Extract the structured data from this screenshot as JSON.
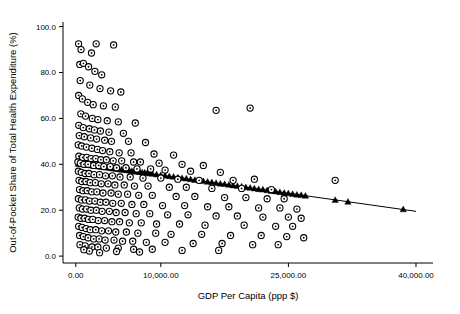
{
  "chart_data": {
    "type": "scatter",
    "title": "",
    "xlabel": "GDP Per Capita (ppp $)",
    "ylabel": "Out-of-Pocket Share of Total Health Expenditure (%)",
    "xlim": [
      -1500,
      42000
    ],
    "ylim": [
      -3,
      102
    ],
    "xticks": [
      0,
      10000,
      25000,
      40000
    ],
    "xticklabels": [
      "0.00",
      "10,000.00",
      "25,000.00",
      "40,000.00"
    ],
    "yticks": [
      0,
      20,
      40,
      60,
      80,
      100
    ],
    "yticklabels": [
      "0.0",
      "20.0",
      "40.0",
      "60.0",
      "80.0",
      "100.0"
    ],
    "grid": false,
    "legend": null,
    "marker_color": "#000000",
    "marker_fill": "#ffffff",
    "fit_color": "#000000",
    "series": [
      {
        "name": "Observed (circles)",
        "marker": "circle-open",
        "points": [
          [
            330,
            92.5
          ],
          [
            620,
            90.0
          ],
          [
            1850,
            88.5
          ],
          [
            2400,
            92.5
          ],
          [
            4450,
            92.0
          ],
          [
            470,
            83.5
          ],
          [
            900,
            84.0
          ],
          [
            1500,
            82.5
          ],
          [
            2250,
            80.5
          ],
          [
            3050,
            79.0
          ],
          [
            520,
            76.5
          ],
          [
            1650,
            74.5
          ],
          [
            2850,
            73.0
          ],
          [
            4100,
            72.0
          ],
          [
            5300,
            71.5
          ],
          [
            340,
            70.0
          ],
          [
            780,
            68.5
          ],
          [
            1400,
            67.0
          ],
          [
            2050,
            66.0
          ],
          [
            3250,
            65.5
          ],
          [
            4650,
            65.0
          ],
          [
            16500,
            63.5
          ],
          [
            20500,
            64.5
          ],
          [
            600,
            62.0
          ],
          [
            1150,
            61.0
          ],
          [
            1950,
            60.0
          ],
          [
            2600,
            59.5
          ],
          [
            3700,
            59.0
          ],
          [
            5000,
            58.5
          ],
          [
            7000,
            58.0
          ],
          [
            350,
            57.0
          ],
          [
            880,
            56.0
          ],
          [
            1600,
            55.5
          ],
          [
            2200,
            55.0
          ],
          [
            2900,
            54.5
          ],
          [
            3900,
            54.0
          ],
          [
            5600,
            53.5
          ],
          [
            410,
            52.5
          ],
          [
            1000,
            52.0
          ],
          [
            1750,
            51.5
          ],
          [
            2450,
            51.0
          ],
          [
            3400,
            50.5
          ],
          [
            4200,
            50.0
          ],
          [
            6200,
            50.0
          ],
          [
            8200,
            49.5
          ],
          [
            290,
            48.5
          ],
          [
            700,
            48.0
          ],
          [
            1250,
            47.5
          ],
          [
            1900,
            47.0
          ],
          [
            2550,
            46.5
          ],
          [
            3150,
            46.0
          ],
          [
            4000,
            45.5
          ],
          [
            5100,
            45.0
          ],
          [
            6500,
            45.0
          ],
          [
            9200,
            44.5
          ],
          [
            11500,
            44.0
          ],
          [
            360,
            43.5
          ],
          [
            810,
            43.0
          ],
          [
            1300,
            43.0
          ],
          [
            1800,
            42.5
          ],
          [
            2350,
            42.5
          ],
          [
            2950,
            42.0
          ],
          [
            3600,
            42.0
          ],
          [
            4400,
            41.5
          ],
          [
            5400,
            41.5
          ],
          [
            6800,
            41.0
          ],
          [
            7600,
            41.0
          ],
          [
            9800,
            40.5
          ],
          [
            12500,
            40.0
          ],
          [
            15000,
            39.5
          ],
          [
            250,
            41.0
          ],
          [
            540,
            40.5
          ],
          [
            960,
            40.0
          ],
          [
            1450,
            40.0
          ],
          [
            2100,
            39.5
          ],
          [
            2700,
            39.5
          ],
          [
            3300,
            39.0
          ],
          [
            4050,
            39.0
          ],
          [
            4800,
            38.5
          ],
          [
            5900,
            38.5
          ],
          [
            7200,
            38.0
          ],
          [
            8800,
            38.0
          ],
          [
            10500,
            37.5
          ],
          [
            13500,
            37.0
          ],
          [
            17000,
            36.5
          ],
          [
            300,
            37.0
          ],
          [
            650,
            36.5
          ],
          [
            1100,
            36.0
          ],
          [
            1550,
            36.0
          ],
          [
            2150,
            35.5
          ],
          [
            2800,
            35.5
          ],
          [
            3500,
            35.0
          ],
          [
            4300,
            35.0
          ],
          [
            5200,
            34.5
          ],
          [
            6400,
            34.5
          ],
          [
            7900,
            34.0
          ],
          [
            10000,
            34.0
          ],
          [
            12000,
            33.5
          ],
          [
            14500,
            33.0
          ],
          [
            18500,
            33.0
          ],
          [
            21000,
            33.5
          ],
          [
            30500,
            33.0
          ],
          [
            380,
            33.0
          ],
          [
            720,
            32.5
          ],
          [
            1200,
            32.5
          ],
          [
            1700,
            32.0
          ],
          [
            2300,
            32.0
          ],
          [
            3000,
            31.5
          ],
          [
            3800,
            31.5
          ],
          [
            4600,
            31.0
          ],
          [
            5700,
            31.0
          ],
          [
            6900,
            30.5
          ],
          [
            8500,
            30.5
          ],
          [
            11000,
            30.0
          ],
          [
            13000,
            30.0
          ],
          [
            16000,
            29.5
          ],
          [
            19500,
            29.5
          ],
          [
            23000,
            29.0
          ],
          [
            440,
            29.0
          ],
          [
            850,
            28.5
          ],
          [
            1350,
            28.5
          ],
          [
            1880,
            28.0
          ],
          [
            2480,
            28.0
          ],
          [
            3200,
            27.5
          ],
          [
            4150,
            27.5
          ],
          [
            5000,
            27.0
          ],
          [
            6100,
            27.0
          ],
          [
            7400,
            26.5
          ],
          [
            9000,
            26.5
          ],
          [
            11800,
            26.0
          ],
          [
            14000,
            26.0
          ],
          [
            17500,
            25.5
          ],
          [
            20000,
            25.5
          ],
          [
            22500,
            25.0
          ],
          [
            24500,
            25.0
          ],
          [
            310,
            25.0
          ],
          [
            680,
            24.5
          ],
          [
            1150,
            24.5
          ],
          [
            1620,
            24.0
          ],
          [
            2250,
            24.0
          ],
          [
            2880,
            23.5
          ],
          [
            3550,
            23.5
          ],
          [
            4350,
            23.0
          ],
          [
            5350,
            23.0
          ],
          [
            6600,
            22.5
          ],
          [
            8000,
            22.5
          ],
          [
            10200,
            22.0
          ],
          [
            12800,
            22.0
          ],
          [
            15500,
            21.5
          ],
          [
            18000,
            21.5
          ],
          [
            21500,
            21.0
          ],
          [
            24000,
            21.0
          ],
          [
            26000,
            20.5
          ],
          [
            420,
            21.0
          ],
          [
            790,
            20.5
          ],
          [
            1280,
            20.5
          ],
          [
            1780,
            20.0
          ],
          [
            2420,
            20.0
          ],
          [
            3100,
            19.5
          ],
          [
            3950,
            19.5
          ],
          [
            4750,
            19.0
          ],
          [
            5800,
            19.0
          ],
          [
            7100,
            18.5
          ],
          [
            8700,
            18.5
          ],
          [
            10800,
            18.0
          ],
          [
            13200,
            18.0
          ],
          [
            16500,
            17.5
          ],
          [
            19000,
            17.5
          ],
          [
            22000,
            17.0
          ],
          [
            25000,
            17.0
          ],
          [
            26500,
            16.5
          ],
          [
            280,
            17.0
          ],
          [
            610,
            16.5
          ],
          [
            1050,
            16.5
          ],
          [
            1500,
            16.0
          ],
          [
            2000,
            16.0
          ],
          [
            2650,
            15.5
          ],
          [
            3400,
            15.5
          ],
          [
            4250,
            15.0
          ],
          [
            5150,
            15.0
          ],
          [
            6300,
            14.5
          ],
          [
            7700,
            14.5
          ],
          [
            9500,
            14.0
          ],
          [
            12200,
            14.0
          ],
          [
            15200,
            13.5
          ],
          [
            19800,
            13.5
          ],
          [
            23500,
            13.0
          ],
          [
            25500,
            13.0
          ],
          [
            340,
            13.0
          ],
          [
            750,
            12.5
          ],
          [
            1220,
            12.0
          ],
          [
            1700,
            11.5
          ],
          [
            2350,
            11.5
          ],
          [
            3050,
            11.0
          ],
          [
            3850,
            11.0
          ],
          [
            4700,
            10.5
          ],
          [
            5950,
            10.5
          ],
          [
            7300,
            10.0
          ],
          [
            9400,
            10.0
          ],
          [
            11200,
            9.5
          ],
          [
            14800,
            9.5
          ],
          [
            18200,
            9.0
          ],
          [
            21800,
            9.0
          ],
          [
            24800,
            8.5
          ],
          [
            26800,
            8.0
          ],
          [
            450,
            9.0
          ],
          [
            900,
            8.5
          ],
          [
            1450,
            8.0
          ],
          [
            2100,
            7.5
          ],
          [
            2750,
            7.5
          ],
          [
            3450,
            7.0
          ],
          [
            4500,
            7.0
          ],
          [
            5500,
            6.5
          ],
          [
            6700,
            6.5
          ],
          [
            8300,
            6.0
          ],
          [
            10500,
            6.0
          ],
          [
            13800,
            5.5
          ],
          [
            17200,
            5.5
          ],
          [
            20800,
            5.0
          ],
          [
            23800,
            5.0
          ],
          [
            500,
            5.0
          ],
          [
            1100,
            4.5
          ],
          [
            1900,
            4.0
          ],
          [
            2600,
            4.0
          ],
          [
            3600,
            3.5
          ],
          [
            5000,
            3.5
          ],
          [
            6800,
            3.0
          ],
          [
            9000,
            3.0
          ],
          [
            12500,
            2.5
          ],
          [
            16800,
            2.5
          ],
          [
            4800,
            2.0
          ],
          [
            7500,
            1.8
          ],
          [
            2800,
            1.5
          ],
          [
            1600,
            2.2
          ],
          [
            950,
            2.8
          ]
        ]
      },
      {
        "name": "Fitted (triangles)",
        "marker": "triangle-filled",
        "points": [
          [
            300,
            40.2
          ],
          [
            600,
            40.1
          ],
          [
            900,
            40.0
          ],
          [
            1200,
            39.8
          ],
          [
            1500,
            39.7
          ],
          [
            1800,
            39.5
          ],
          [
            2100,
            39.4
          ],
          [
            2400,
            39.2
          ],
          [
            2700,
            39.1
          ],
          [
            3000,
            38.9
          ],
          [
            3300,
            38.8
          ],
          [
            3600,
            38.6
          ],
          [
            3900,
            38.5
          ],
          [
            4200,
            38.3
          ],
          [
            4500,
            38.2
          ],
          [
            4800,
            38.0
          ],
          [
            5100,
            37.9
          ],
          [
            5400,
            37.7
          ],
          [
            5700,
            37.6
          ],
          [
            6000,
            37.4
          ],
          [
            6300,
            37.3
          ],
          [
            6600,
            37.1
          ],
          [
            6900,
            37.0
          ],
          [
            7200,
            36.8
          ],
          [
            7500,
            36.7
          ],
          [
            7800,
            36.5
          ],
          [
            8100,
            36.4
          ],
          [
            8400,
            36.2
          ],
          [
            8700,
            36.1
          ],
          [
            9000,
            35.9
          ],
          [
            9500,
            35.6
          ],
          [
            10000,
            35.4
          ],
          [
            10500,
            35.1
          ],
          [
            11000,
            34.8
          ],
          [
            11500,
            34.6
          ],
          [
            12000,
            34.3
          ],
          [
            12500,
            34.0
          ],
          [
            13000,
            33.8
          ],
          [
            13500,
            33.5
          ],
          [
            14000,
            33.2
          ],
          [
            14500,
            33.0
          ],
          [
            15000,
            32.7
          ],
          [
            15500,
            32.4
          ],
          [
            16000,
            32.2
          ],
          [
            16500,
            31.9
          ],
          [
            17000,
            31.6
          ],
          [
            17500,
            31.4
          ],
          [
            18000,
            31.1
          ],
          [
            18500,
            30.8
          ],
          [
            19000,
            30.6
          ],
          [
            19500,
            30.3
          ],
          [
            20000,
            30.0
          ],
          [
            20500,
            29.8
          ],
          [
            21000,
            29.5
          ],
          [
            21500,
            29.2
          ],
          [
            22000,
            29.0
          ],
          [
            22500,
            28.7
          ],
          [
            23000,
            28.4
          ],
          [
            23500,
            28.2
          ],
          [
            24000,
            27.9
          ],
          [
            24500,
            27.6
          ],
          [
            25000,
            27.4
          ],
          [
            25500,
            27.1
          ],
          [
            26000,
            26.8
          ],
          [
            26500,
            26.6
          ],
          [
            27000,
            26.3
          ],
          [
            30500,
            24.5
          ],
          [
            32000,
            23.7
          ],
          [
            38500,
            20.4
          ]
        ]
      }
    ],
    "fit_line": {
      "x1": 0,
      "y1": 40.5,
      "x2": 40000,
      "y2": 19.5
    }
  }
}
